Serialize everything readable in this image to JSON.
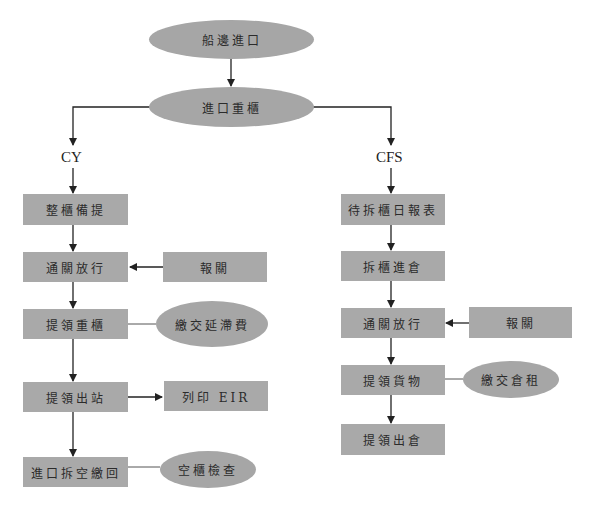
{
  "diagram": {
    "type": "flowchart",
    "start": "船邊進口",
    "main": "進口重櫃",
    "branches": {
      "cy": {
        "label": "CY",
        "steps": [
          "整櫃備提",
          "通關放行",
          "提領重櫃",
          "提領出站",
          "進口拆空繳回"
        ],
        "side": {
          "customs": "報關",
          "demurrage": "繳交延滯費",
          "print_eir": "列印 EIR",
          "empty_check": "空櫃檢查"
        }
      },
      "cfs": {
        "label": "CFS",
        "steps": [
          "待拆櫃日報表",
          "拆櫃進倉",
          "通關放行",
          "提領貨物",
          "提領出倉"
        ],
        "side": {
          "customs": "報關",
          "storage_fee": "繳交倉租"
        }
      }
    },
    "colors": {
      "node_fill": "#a8a8a8",
      "line": "#222222",
      "text": "#2b2b2b"
    }
  }
}
